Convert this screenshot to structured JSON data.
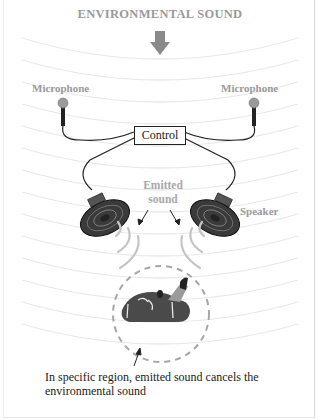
{
  "title": "ENVIRONMENTAL SOUND",
  "labels": {
    "microphone_left": "Microphone",
    "microphone_right": "Microphone",
    "control": "Control",
    "emitted_sound": "Emitted sound",
    "speaker": "Speaker"
  },
  "caption": "In specific region, emitted sound cancels the environmental sound",
  "colors": {
    "label_gray": "#9a9a9a",
    "wave_lines": "#e6e6e6",
    "speaker_dark": "#3a3a3a",
    "head_dark": "#4a4a4a",
    "dashed_circle": "#a0a0a0"
  }
}
